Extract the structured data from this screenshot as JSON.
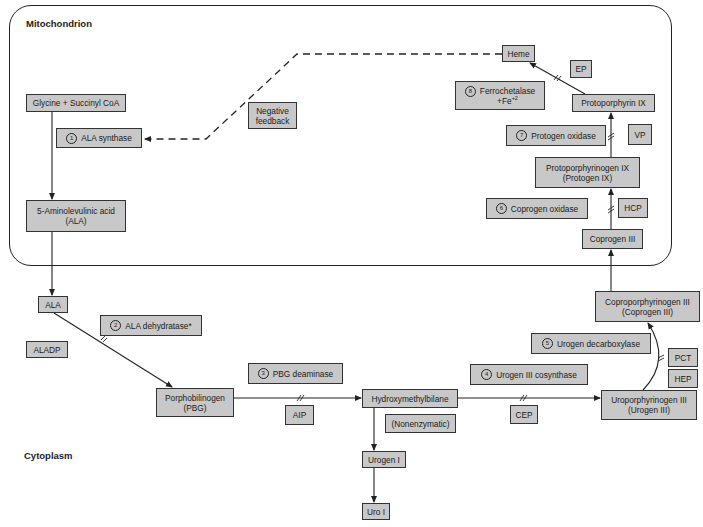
{
  "regions": {
    "mitochondrion": "Mitochondrion",
    "cytoplasm": "Cytoplasm"
  },
  "metabolites": {
    "glycine": "Glycine + Succinyl CoA",
    "ala_mito_line1": "5-Aminolevulinic acid",
    "ala_mito_line2": "(ALA)",
    "ala_cyto": "ALA",
    "pbg_line1": "Porphobilinogen",
    "pbg_line2": "(PBG)",
    "hmb": "Hydroxymethylbilane",
    "urogen1": "Urogen I",
    "uro1": "Uro I",
    "urogen3_line1": "Uroporphyrinogen III",
    "urogen3_line2": "(Urogen III)",
    "coprogen3full_line1": "Coproporphyrinogen III",
    "coprogen3full_line2": "(Coprogen III)",
    "coprogen3": "Coprogen III",
    "protogen_line1": "Protoporphyrinogen IX",
    "protogen_line2": "(Protogen IX)",
    "protoporphyrin": "Protoporphyrin IX",
    "heme": "Heme"
  },
  "enzymes": [
    {
      "num": "1",
      "label": "ALA synthase"
    },
    {
      "num": "2",
      "label": "ALA dehydratase*"
    },
    {
      "num": "3",
      "label": "PBG deaminase"
    },
    {
      "num": "4",
      "label": "Urogen III cosynthase"
    },
    {
      "num": "5",
      "label": "Urogen decarboxylase"
    },
    {
      "num": "6",
      "label": "Coprogen oxidase"
    },
    {
      "num": "7",
      "label": "Protogen oxidase"
    },
    {
      "num": "8",
      "label_line1": "Ferrochetalase",
      "label_line2": "+Fe",
      "superscript": "+2"
    }
  ],
  "notes": {
    "negative_feedback_line1": "Negative",
    "negative_feedback_line2": "feedback",
    "nonenzymatic": "(Nonenzymatic)"
  },
  "diseases": {
    "aladp": "ALADP",
    "aip": "AIP",
    "cep": "CEP",
    "pct": "PCT",
    "hep": "HEP",
    "hcp": "HCP",
    "vp": "VP",
    "ep": "EP"
  },
  "colors": {
    "box_fill": "#c8c8c8",
    "box_border": "#333333",
    "line": "#222222",
    "background": "#ffffff"
  }
}
